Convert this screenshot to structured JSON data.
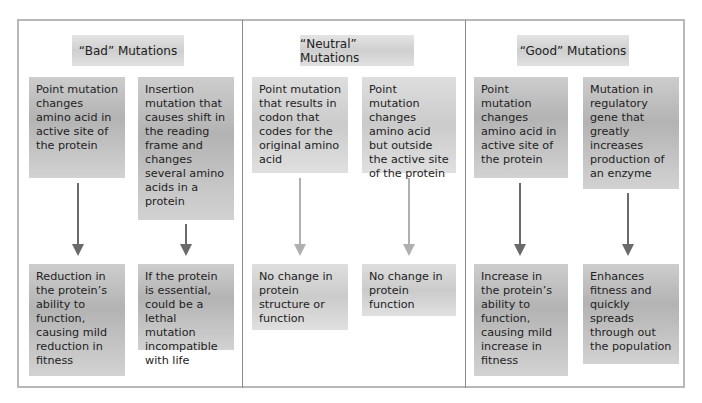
{
  "diagram": {
    "type": "flowchart",
    "columns": [
      {
        "header": "“Bad” Mutations",
        "items": [
          {
            "cause": "Point mutation changes amino acid in active site of the protein",
            "effect": "Reduction in the protein’s ability to function, causing mild reduction in fitness"
          },
          {
            "cause": "Insertion mutation that causes shift in the reading frame and changes several amino acids in a protein",
            "effect": "If the protein is essential, could be a lethal mutation incompatible with life"
          }
        ]
      },
      {
        "header": "“Neutral” Mutations",
        "items": [
          {
            "cause": "Point mutation that results in codon that codes for the original amino acid",
            "effect": "No change in protein structure or function"
          },
          {
            "cause": "Point mutation changes amino acid but outside the active site of the protein",
            "effect": "No change in protein function"
          }
        ]
      },
      {
        "header": "“Good” Mutations",
        "items": [
          {
            "cause": "Point mutation changes amino acid in active site of the protein",
            "effect": "Increase in the protein’s ability to function, causing mild increase in fitness"
          },
          {
            "cause": "Mutation in regulatory gene that greatly increases production of an enzyme",
            "effect": "Enhances fitness and quickly spreads through out the population"
          }
        ]
      }
    ],
    "colors": {
      "frame": "#b8b8b8",
      "divider": "#8a8a8a",
      "arrow_dark": "#6a6a6a",
      "arrow_light": "#b0b0b0",
      "box_gray": "#bdbdbd"
    }
  }
}
